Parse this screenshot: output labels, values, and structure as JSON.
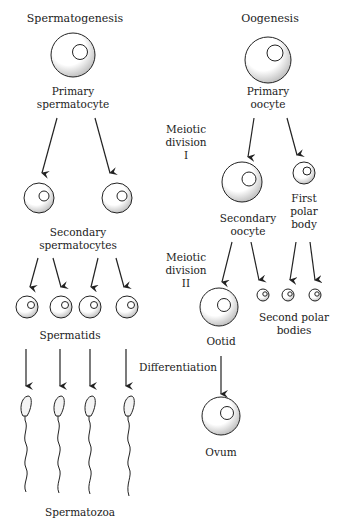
{
  "diagram": {
    "left_title": "Spermatogenesis",
    "right_title": "Oogenesis",
    "stages": {
      "meiotic_division_1": [
        "Meiotic",
        "division",
        "I"
      ],
      "meiotic_division_2": [
        "Meiotic",
        "division",
        "II"
      ],
      "differentiation": "Differentiation"
    },
    "spermatogenesis": {
      "primary": [
        "Primary",
        "spermatocyte"
      ],
      "secondary": [
        "Secondary",
        "spermatocytes"
      ],
      "spermatids": "Spermatids",
      "spermatozoa": "Spermatozoa"
    },
    "oogenesis": {
      "primary": [
        "Primary",
        "oocyte"
      ],
      "secondary": [
        "Secondary",
        "oocyte"
      ],
      "first_polar_body": [
        "First",
        "polar",
        "body"
      ],
      "ootid": "Ootid",
      "second_polar_bodies": [
        "Second polar",
        "bodies"
      ],
      "ovum": "Ovum"
    }
  }
}
